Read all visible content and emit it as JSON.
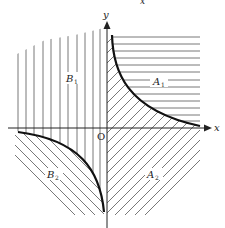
{
  "diagram": {
    "top_fragment": "x",
    "axes": {
      "x_label": "x",
      "y_label": "y",
      "origin_label": "O"
    },
    "regions": [
      {
        "id": "A1",
        "label": "A",
        "subscript": "1",
        "hatch": "horizontal",
        "quadrant": "I (above curve)"
      },
      {
        "id": "A2",
        "label": "A",
        "subscript": "2",
        "hatch": "diagonal-forward",
        "quadrant": "IV and I below curve"
      },
      {
        "id": "B1",
        "label": "B",
        "subscript": "1",
        "hatch": "vertical",
        "quadrant": "II and III above curve"
      },
      {
        "id": "B2",
        "label": "B",
        "subscript": "2",
        "hatch": "diagonal-back",
        "quadrant": "III (below curve)"
      }
    ],
    "curves": [
      {
        "name": "hyperbola-branch-q1",
        "description": "xy = c, first quadrant"
      },
      {
        "name": "hyperbola-branch-q3",
        "description": "xy = c, third quadrant"
      }
    ],
    "colors": {
      "ink": "#222222",
      "hatch": "#555555",
      "background": "#ffffff"
    }
  }
}
